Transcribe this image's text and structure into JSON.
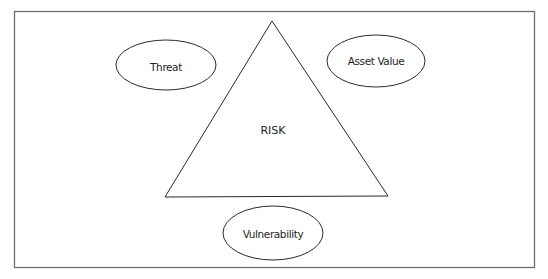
{
  "diagram": {
    "type": "risk-triangle",
    "center": {
      "label": "RISK",
      "shape": "triangle"
    },
    "factors": [
      {
        "id": "threat",
        "label": "Threat",
        "shape": "ellipse",
        "position": "top-left"
      },
      {
        "id": "asset_value",
        "label": "Asset Value",
        "shape": "ellipse",
        "position": "top-right"
      },
      {
        "id": "vulnerability",
        "label": "Vulnerability",
        "shape": "ellipse",
        "position": "bottom"
      }
    ],
    "colors": {
      "background": "#ffffff",
      "frame_stroke": "#6e6e6e",
      "shape_stroke": "#2a2a2a",
      "text": "#1e1e1e"
    }
  }
}
